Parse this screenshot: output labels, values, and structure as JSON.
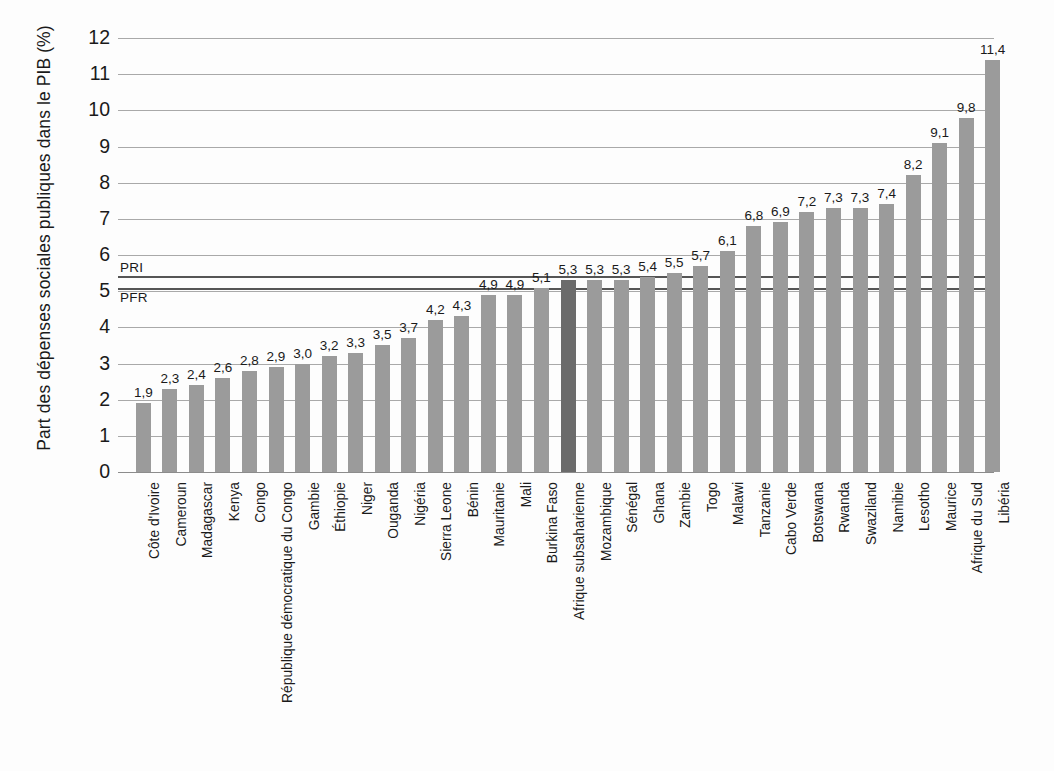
{
  "chart_data": {
    "type": "bar",
    "title": "",
    "subtitle": "",
    "xlabel": "",
    "ylabel": "Part des dépenses sociales publiques dans le PIB (%)",
    "ylim": [
      0,
      12
    ],
    "ytick_labels": [
      "0",
      "1",
      "2",
      "3",
      "4",
      "5",
      "6",
      "7",
      "8",
      "9",
      "10",
      "11",
      "12"
    ],
    "ytick_values": [
      0,
      1,
      2,
      3,
      4,
      5,
      6,
      7,
      8,
      9,
      10,
      11,
      12
    ],
    "grid": true,
    "legend_position": "none",
    "decimal_separator": ",",
    "categories": [
      "Côte d'Ivoire",
      "Cameroun",
      "Madagascar",
      "Kenya",
      "Congo",
      "République démocratique du Congo",
      "Gambie",
      "Éthiopie",
      "Niger",
      "Ouganda",
      "Nigéria",
      "Sierra Leone",
      "Bénin",
      "Mauritanie",
      "Mali",
      "Burkina Faso",
      "Afrique subsaharienne",
      "Mozambique",
      "Sénégal",
      "Ghana",
      "Zambie",
      "Togo",
      "Malawi",
      "Tanzanie",
      "Cabo Verde",
      "Botswana",
      "Rwanda",
      "Swaziland",
      "Namibie",
      "Lesotho",
      "Maurice",
      "Afrique du Sud",
      "Libéria"
    ],
    "values": [
      1.9,
      2.3,
      2.4,
      2.6,
      2.8,
      2.9,
      3.0,
      3.2,
      3.3,
      3.5,
      3.7,
      4.2,
      4.3,
      4.9,
      4.9,
      5.1,
      5.3,
      5.3,
      5.3,
      5.4,
      5.5,
      5.7,
      6.1,
      6.8,
      6.9,
      7.2,
      7.3,
      7.3,
      7.4,
      8.2,
      9.1,
      9.8,
      11.4
    ],
    "value_labels": [
      "1,9",
      "2,3",
      "2,4",
      "2,6",
      "2,8",
      "2,9",
      "3,0",
      "3,2",
      "3,3",
      "3,5",
      "3,7",
      "4,2",
      "4,3",
      "4,9",
      "4,9",
      "5,1",
      "5,3",
      "5,3",
      "5,3",
      "5,4",
      "5,5",
      "5,7",
      "6,1",
      "6,8",
      "6,9",
      "7,2",
      "7,3",
      "7,3",
      "7,4",
      "8,2",
      "9,1",
      "9,8",
      "11,4"
    ],
    "highlight_category": "Afrique subsaharienne",
    "highlight_index": 16,
    "reference_lines": [
      {
        "label": "PRI",
        "value": 5.43,
        "label_side": "above"
      },
      {
        "label": "PFR",
        "value": 5.08,
        "label_side": "below"
      }
    ],
    "colors": {
      "bar": "#9b9b9b",
      "bar_highlight": "#6b6b6b",
      "gridline": "#a9a9a9",
      "reference_line": "#555555",
      "text": "#1a1a1a",
      "background": "#fdfdfd"
    }
  }
}
